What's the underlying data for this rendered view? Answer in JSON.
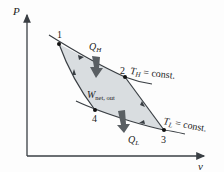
{
  "diagram": {
    "type": "Carnot cycle P-v diagram",
    "axes": {
      "y_label": "P",
      "x_label": "v"
    },
    "points": [
      {
        "id": "1",
        "label": "1"
      },
      {
        "id": "2",
        "label": "2"
      },
      {
        "id": "3",
        "label": "3"
      },
      {
        "id": "4",
        "label": "4"
      }
    ],
    "isotherms": {
      "high": {
        "label_main": "T",
        "label_sub": "H",
        "label_rest": " = const."
      },
      "low": {
        "label_main": "T",
        "label_sub": "L",
        "label_rest": " = const."
      }
    },
    "heat_in": {
      "main": "Q",
      "sub": "H"
    },
    "heat_out": {
      "main": "Q",
      "sub": "L"
    },
    "work": {
      "main": "W",
      "sub": "net, out"
    },
    "colors": {
      "cycle_fill": "#d9dde0",
      "arrow_fill": "#5a5f63",
      "line": "#3a3f44",
      "axis": "#3a3f44"
    }
  }
}
